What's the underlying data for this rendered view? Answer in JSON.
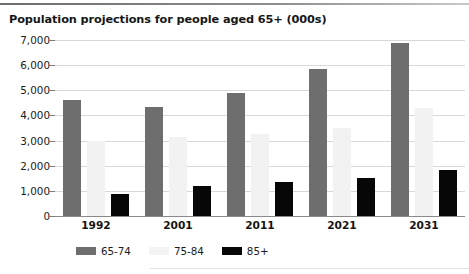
{
  "chart_data": {
    "type": "bar",
    "title": "Population projections for people aged 65+ (000s)",
    "xlabel": "",
    "ylabel": "",
    "categories": [
      "1992",
      "2001",
      "2011",
      "2021",
      "2031"
    ],
    "series": [
      {
        "name": "65-74",
        "color": "#6e6e6e",
        "values": [
          4600,
          4350,
          4880,
          5850,
          6900
        ]
      },
      {
        "name": "75-84",
        "color": "#f2f2f2",
        "values": [
          3000,
          3150,
          3250,
          3500,
          4300
        ]
      },
      {
        "name": "85+",
        "color": "#070707",
        "values": [
          880,
          1180,
          1350,
          1500,
          1850
        ]
      }
    ],
    "ylim": [
      0,
      7000
    ],
    "ytick_values": [
      0,
      1000,
      2000,
      3000,
      4000,
      5000,
      6000,
      7000
    ],
    "ytick_labels": [
      "0",
      "1,000",
      "2,000",
      "3,000",
      "4,000",
      "5,000",
      "6,000",
      "7,000"
    ],
    "grid": true,
    "legend_position": "bottom-left"
  },
  "legend": {
    "items": [
      {
        "label": "65-74"
      },
      {
        "label": "75-84"
      },
      {
        "label": "85+"
      }
    ]
  }
}
